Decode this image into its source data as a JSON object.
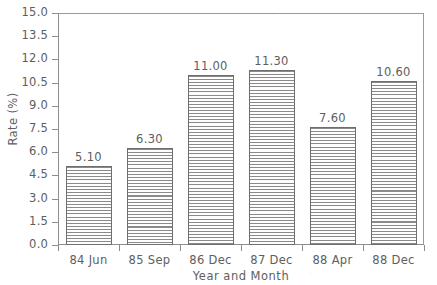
{
  "chart_data": {
    "type": "bar",
    "title": "",
    "subtitle": "",
    "xlabel": "Year and Month",
    "ylabel": "Rate (%)",
    "categories": [
      "84 Jun",
      "85 Sep",
      "86 Dec",
      "87 Dec",
      "88 Apr",
      "88 Dec"
    ],
    "values": [
      5.1,
      6.3,
      11.0,
      11.3,
      7.6,
      10.6
    ],
    "value_labels": [
      "5.10",
      "6.30",
      "11.00",
      "11.30",
      "7.60",
      "10.60"
    ],
    "ylim": [
      0.0,
      15.0
    ],
    "ytick_values": [
      0.0,
      1.5,
      3.0,
      4.5,
      6.0,
      7.5,
      9.0,
      10.5,
      12.0,
      13.5,
      15.0
    ],
    "ytick_labels": [
      "0.0",
      "1.5",
      "3.0",
      "4.5",
      "6.0",
      "7.5",
      "9.0",
      "10.5",
      "12.0",
      "13.5",
      "15.0"
    ],
    "grid": false,
    "legend": false,
    "legend_position": "none",
    "bar_fill": "horizontal-hatch",
    "colors": {
      "axis": "#8e8e8e",
      "text": "#5e5e5e",
      "bar_edge": "#6e6e6e",
      "bar_hatch": "#8a8a8a",
      "background": "#ffffff"
    }
  }
}
